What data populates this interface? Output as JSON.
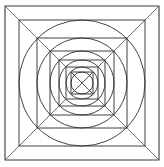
{
  "figure": {
    "background_color": "#ffffff",
    "stroke_color": "#2b2b2b",
    "diagonal_color": "#555555",
    "canvas": {
      "width": 164,
      "height": 167
    },
    "center": {
      "x": 82,
      "y": 83
    },
    "squares": [
      {
        "name": "square-1-outer",
        "half": 77
      },
      {
        "name": "square-2",
        "half": 63
      },
      {
        "name": "square-3",
        "half": 45
      },
      {
        "name": "square-4",
        "half": 32
      },
      {
        "name": "square-5",
        "half": 23
      },
      {
        "name": "square-6",
        "half": 16
      },
      {
        "name": "square-7-inner",
        "half": 11
      }
    ],
    "circles": [
      {
        "name": "circle-1-outer",
        "radius": 63
      },
      {
        "name": "circle-2",
        "radius": 45
      },
      {
        "name": "circle-3",
        "radius": 32
      },
      {
        "name": "circle-4",
        "radius": 23
      },
      {
        "name": "circle-5",
        "radius": 16
      },
      {
        "name": "circle-6-inner",
        "radius": 11
      }
    ],
    "corner_diagonals": [
      {
        "name": "diagonal-top-left",
        "from": [
          5,
          6
        ],
        "to": [
          66,
          67
        ]
      },
      {
        "name": "diagonal-top-right",
        "from": [
          159,
          6
        ],
        "to": [
          98,
          67
        ]
      },
      {
        "name": "diagonal-bottom-left",
        "from": [
          5,
          160
        ],
        "to": [
          66,
          99
        ]
      },
      {
        "name": "diagonal-bottom-right",
        "from": [
          159,
          160
        ],
        "to": [
          98,
          99
        ]
      }
    ],
    "center_cross": [
      {
        "name": "center-x-line-1",
        "from": [
          71,
          72
        ],
        "to": [
          93,
          94
        ]
      },
      {
        "name": "center-x-line-2",
        "from": [
          93,
          72
        ],
        "to": [
          71,
          94
        ]
      }
    ]
  }
}
